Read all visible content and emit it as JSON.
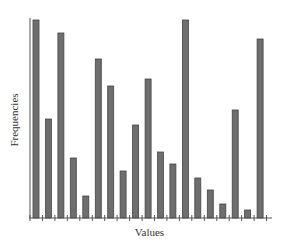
{
  "chart_data": {
    "type": "bar",
    "title": "",
    "xlabel": "Values",
    "ylabel": "Frequencies",
    "categories": [
      "1",
      "2",
      "3",
      "4",
      "5",
      "6",
      "7",
      "8",
      "9",
      "10",
      "11",
      "12",
      "13",
      "14",
      "15",
      "16",
      "17",
      "18",
      "19"
    ],
    "values": [
      198,
      99,
      185,
      60,
      22,
      159,
      132,
      47,
      93,
      139,
      66,
      54,
      198,
      40,
      28,
      14,
      108,
      8,
      179
    ],
    "ylim": [
      0,
      200
    ],
    "grid": false,
    "legend": null,
    "tick_labels_visible": false,
    "bar_color": "#6e6e6e",
    "bar_edge_color": "#444444",
    "axis_color": "#555555"
  },
  "axes": {
    "xlabel": "Values",
    "ylabel": "Frequencies"
  }
}
